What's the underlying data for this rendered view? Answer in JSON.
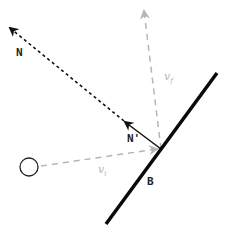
{
  "diagram": {
    "type": "reflection-vector-diagram",
    "labels": {
      "normal": "N",
      "normal_prime": "N'",
      "v_final": "v",
      "v_final_sub": "f",
      "v_initial": "v",
      "v_initial_sub": "i",
      "wall": "B"
    },
    "colors": {
      "primary": "#111111",
      "secondary": "#b5b5b5",
      "background": "#ffffff"
    },
    "elements": [
      {
        "id": "wall",
        "kind": "line",
        "from": [
          217,
          73
        ],
        "to": [
          106,
          224
        ],
        "style": "solid-thick"
      },
      {
        "id": "normal-prime",
        "kind": "arrow",
        "from": [
          161,
          149
        ],
        "to": [
          124,
          121
        ],
        "style": "solid"
      },
      {
        "id": "normal",
        "kind": "arrow",
        "from": [
          124,
          121
        ],
        "to": [
          9,
          27
        ],
        "style": "dotted"
      },
      {
        "id": "v-final",
        "kind": "arrow",
        "from": [
          161,
          149
        ],
        "to": [
          144,
          10
        ],
        "style": "dashed-gray"
      },
      {
        "id": "v-initial",
        "kind": "arrow",
        "from": [
          40,
          166
        ],
        "to": [
          158,
          149
        ],
        "style": "dashed-gray"
      },
      {
        "id": "ball",
        "kind": "circle",
        "center": [
          29,
          167
        ],
        "radius": 9
      }
    ]
  }
}
